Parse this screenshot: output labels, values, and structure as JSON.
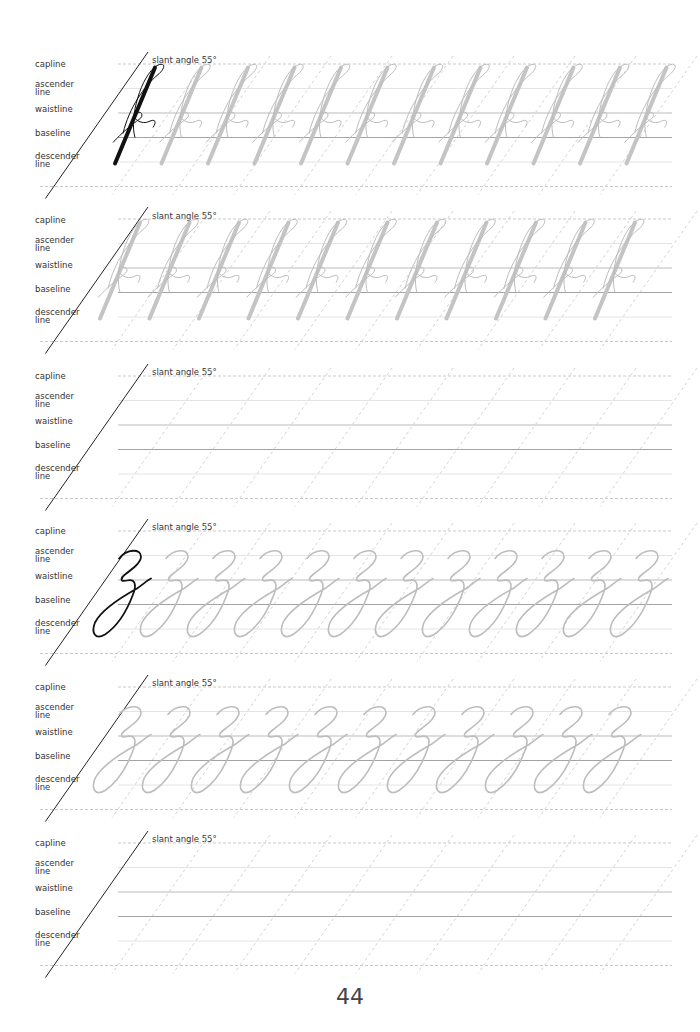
{
  "worksheet": {
    "line_labels": {
      "capline": "capline",
      "ascender": "ascender\nline",
      "ascender_1": "ascender",
      "ascender_2": "line",
      "waistline": "waistline",
      "baseline": "baseline",
      "descender_1": "descender",
      "descender_2": "line"
    },
    "slant_label": "slant angle 55°",
    "rows": [
      {
        "letter": "f",
        "mode": "example+trace",
        "trace_count": 11
      },
      {
        "letter": "f",
        "mode": "trace",
        "trace_count": 11
      },
      {
        "letter": "",
        "mode": "blank",
        "trace_count": 0
      },
      {
        "letter": "z",
        "mode": "example+trace",
        "trace_count": 11
      },
      {
        "letter": "z",
        "mode": "trace",
        "trace_count": 11
      },
      {
        "letter": "",
        "mode": "blank",
        "trace_count": 0
      }
    ],
    "colors": {
      "ink": "#111111",
      "trace": "#bdbdbd",
      "guide": "#c8c8c8",
      "label": "#333333"
    }
  },
  "footer": {
    "page_number": "44"
  }
}
